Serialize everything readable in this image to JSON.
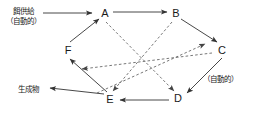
{
  "figure": {
    "width": 261,
    "height": 115,
    "background": "#ffffff",
    "stroke_color": "#333333",
    "dashed_color": "#555555"
  },
  "nodes": [
    {
      "id": "A",
      "label": "A",
      "x": 105,
      "y": 13
    },
    {
      "id": "B",
      "label": "B",
      "x": 176,
      "y": 13
    },
    {
      "id": "C",
      "label": "C",
      "x": 222,
      "y": 50
    },
    {
      "id": "D",
      "label": "D",
      "x": 178,
      "y": 98
    },
    {
      "id": "E",
      "label": "E",
      "x": 110,
      "y": 99
    },
    {
      "id": "F",
      "label": "F",
      "x": 68,
      "y": 50
    }
  ],
  "annotations": {
    "feed_supply": {
      "line1": "餌供給",
      "line2": "（自動的）",
      "x": 8,
      "y": 9
    },
    "product": {
      "text": "生成物",
      "x": 18,
      "y": 90
    },
    "automatic_right": {
      "text": "（自動的）",
      "x": 203,
      "y": 79
    }
  },
  "solid_edges": [
    {
      "from": "supply-arrow",
      "to": "A",
      "label": "餌供給 → A"
    },
    {
      "from": "A",
      "to": "B",
      "label": "A → B"
    },
    {
      "from": "B",
      "to": "C",
      "label": "B → C"
    },
    {
      "from": "C",
      "to": "D",
      "label": "C → D"
    },
    {
      "from": "D",
      "to": "E",
      "label": "D → E"
    },
    {
      "from": "E",
      "to": "F",
      "label": "E → F"
    },
    {
      "from": "F",
      "to": "A",
      "label": "F → A"
    },
    {
      "from": "E",
      "to": "product",
      "label": "E → 生成物"
    }
  ],
  "dashed_edges": [
    {
      "from": "A",
      "to": "D",
      "label": "A ⇢ D"
    },
    {
      "from": "B",
      "to": "E",
      "label": "B ⇢ E"
    },
    {
      "from": "C",
      "to": "F",
      "label": "C ⇢ F"
    },
    {
      "from": "E",
      "to": "B",
      "label": "E ⇢ B"
    }
  ]
}
